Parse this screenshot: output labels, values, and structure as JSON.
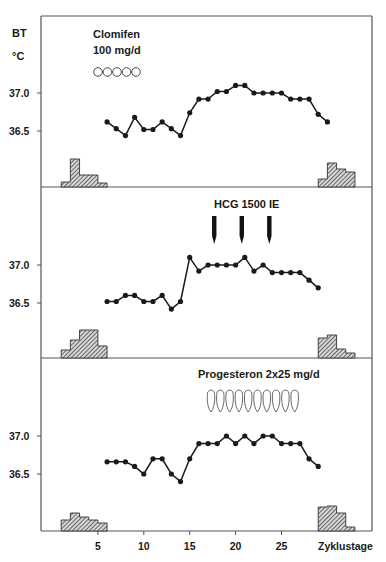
{
  "chart_data": {
    "type": "line",
    "title": "",
    "xlabel": "Zyklustage",
    "ylabel": "BT °C",
    "x_ticks": [
      5,
      10,
      15,
      20,
      25
    ],
    "y_ticks": [
      "37.0",
      "36.5"
    ],
    "x_range": [
      0,
      32
    ],
    "panels": [
      {
        "annotation": [
          "Clomifen",
          "100 mg/d"
        ],
        "pill_symbols": {
          "shape": "circle",
          "count": 5
        },
        "series": {
          "name": "Basaltemperatur",
          "x": [
            6,
            7,
            8,
            9,
            10,
            11,
            12,
            13,
            14,
            15,
            16,
            17,
            18,
            19,
            20,
            21,
            22,
            23,
            24,
            25,
            26,
            27,
            28,
            29,
            30
          ],
          "values": [
            36.62,
            36.53,
            36.44,
            36.68,
            36.52,
            36.52,
            36.62,
            36.53,
            36.44,
            36.74,
            36.92,
            36.92,
            37.02,
            37.02,
            37.1,
            37.1,
            37.0,
            37.0,
            37.0,
            37.0,
            36.92,
            36.92,
            36.92,
            36.72,
            36.62
          ]
        },
        "menstruation_start": [
          {
            "from": 1,
            "to": 2,
            "h": 5
          },
          {
            "from": 2,
            "to": 3,
            "h": 28
          },
          {
            "from": 3,
            "to": 5,
            "h": 12
          },
          {
            "from": 5,
            "to": 6,
            "h": 4
          }
        ],
        "menstruation_end": [
          {
            "from": 29,
            "to": 30,
            "h": 8
          },
          {
            "from": 30,
            "to": 31,
            "h": 24
          },
          {
            "from": 31,
            "to": 32,
            "h": 18
          },
          {
            "from": 32,
            "to": 33,
            "h": 15
          }
        ]
      },
      {
        "annotation": [
          "HCG  1500 IE"
        ],
        "arrows_at_days": [
          18,
          21,
          24
        ],
        "series": {
          "name": "Basaltemperatur",
          "x": [
            6,
            7,
            8,
            9,
            10,
            11,
            12,
            13,
            14,
            15,
            16,
            17,
            18,
            19,
            20,
            21,
            22,
            23,
            24,
            25,
            26,
            27,
            28,
            29
          ],
          "values": [
            36.52,
            36.52,
            36.6,
            36.6,
            36.52,
            36.52,
            36.6,
            36.42,
            36.52,
            37.1,
            36.92,
            37.0,
            37.0,
            37.0,
            37.0,
            37.1,
            36.92,
            37.0,
            36.9,
            36.9,
            36.9,
            36.9,
            36.8,
            36.7
          ]
        },
        "menstruation_start": [
          {
            "from": 1,
            "to": 2,
            "h": 8
          },
          {
            "from": 2,
            "to": 3,
            "h": 18
          },
          {
            "from": 3,
            "to": 5,
            "h": 28
          },
          {
            "from": 5,
            "to": 6,
            "h": 12
          }
        ],
        "menstruation_end": [
          {
            "from": 29,
            "to": 30,
            "h": 20
          },
          {
            "from": 30,
            "to": 31,
            "h": 23
          },
          {
            "from": 31,
            "to": 32,
            "h": 9
          },
          {
            "from": 32,
            "to": 33,
            "h": 5
          }
        ]
      },
      {
        "annotation": [
          "Progesteron  2x25  mg/d"
        ],
        "pill_symbols": {
          "shape": "capsule",
          "count": 10
        },
        "series": {
          "name": "Basaltemperatur",
          "x": [
            6,
            7,
            8,
            9,
            10,
            11,
            12,
            13,
            14,
            15,
            16,
            17,
            18,
            19,
            20,
            21,
            22,
            23,
            24,
            25,
            26,
            27,
            28,
            29
          ],
          "values": [
            36.66,
            36.66,
            36.66,
            36.6,
            36.5,
            36.7,
            36.7,
            36.5,
            36.4,
            36.7,
            36.9,
            36.9,
            36.9,
            37.0,
            36.9,
            37.0,
            36.9,
            37.0,
            37.0,
            36.9,
            36.9,
            36.9,
            36.7,
            36.6
          ]
        },
        "menstruation_start": [
          {
            "from": 1,
            "to": 2,
            "h": 11
          },
          {
            "from": 2,
            "to": 3,
            "h": 18
          },
          {
            "from": 3,
            "to": 4,
            "h": 14
          },
          {
            "from": 4,
            "to": 5,
            "h": 11
          },
          {
            "from": 5,
            "to": 6,
            "h": 8
          }
        ],
        "menstruation_end": [
          {
            "from": 29,
            "to": 30,
            "h": 24
          },
          {
            "from": 30,
            "to": 31,
            "h": 25
          },
          {
            "from": 31,
            "to": 32,
            "h": 18
          },
          {
            "from": 32,
            "to": 33,
            "h": 4
          }
        ]
      }
    ],
    "grid": false,
    "legend": null
  },
  "labels": {
    "y_unit_top": "BT",
    "y_unit_bottom": "°C",
    "p1_line1": "Clomifen",
    "p1_line2": "100  mg/d",
    "p2_title": "HCG   1500  IE",
    "p3_title": "Progesteron  2x25  mg/d",
    "y37": "37.0",
    "y365": "36.5",
    "x5": "5",
    "x10": "10",
    "x15": "15",
    "x20": "20",
    "x25": "25",
    "xlabel": "Zyklustage"
  },
  "colors": {
    "ink": "#1a1a1a",
    "frame": "#555555",
    "hatch_fill": "#8a8a8a"
  }
}
